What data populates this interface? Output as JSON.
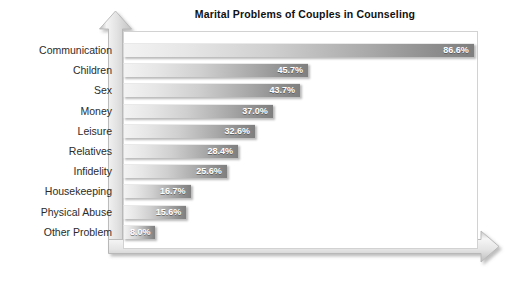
{
  "chart_data": {
    "type": "bar",
    "orientation": "horizontal",
    "title": "Marital Problems of Couples in Counseling",
    "xlabel": "",
    "ylabel": "",
    "xlim": [
      0,
      100
    ],
    "grid": false,
    "legend": "none",
    "value_suffix": "%",
    "categories": [
      "Communication",
      "Children",
      "Sex",
      "Money",
      "Leisure",
      "Relatives",
      "Infidelity",
      "Housekeeping",
      "Physical Abuse",
      "Other Problem"
    ],
    "values": [
      86.6,
      45.7,
      43.7,
      37.0,
      32.6,
      28.4,
      25.6,
      16.7,
      15.6,
      8.0
    ],
    "value_labels": [
      "86.6%",
      "45.7%",
      "43.7%",
      "37.0%",
      "32.6%",
      "28.4%",
      "25.6%",
      "16.7%",
      "15.6%",
      "8.0%"
    ],
    "colors": {
      "bar_gradient_start": "#f3f3f3",
      "bar_gradient_end": "#7f7f7f",
      "value_label_text": "#ffffff",
      "category_label_text": "#2b2b2b",
      "title_text": "#111111",
      "plot_background": "#ffffff",
      "plot_border": "#d2d2d2",
      "axis_arrow": "#e2e2e2"
    }
  },
  "axis": {
    "vertical_arrow_name": "up-arrow-icon",
    "horizontal_arrow_name": "right-arrow-icon"
  }
}
